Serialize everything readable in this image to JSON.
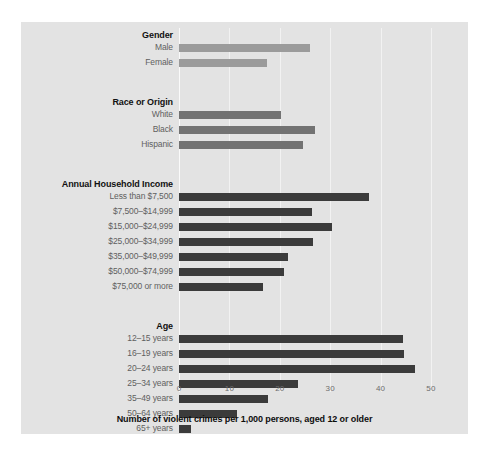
{
  "chart_data": {
    "type": "bar",
    "orientation": "horizontal",
    "title": "",
    "xlabel": "Number of violent crimes per 1,000 persons, aged 12 or older",
    "ylabel": "",
    "xlim": [
      0,
      55
    ],
    "xticks": [
      0,
      10,
      20,
      30,
      40,
      50
    ],
    "xtick_labels": [
      "0",
      "10",
      "20",
      "30",
      "40",
      "50"
    ],
    "grid": true,
    "legend": "none",
    "background_color": "#e3e3e3",
    "groups": [
      {
        "name": "Gender",
        "color": "#9b9b9b",
        "categories": [
          "Male",
          "Female"
        ],
        "values": [
          25.9,
          17.5
        ]
      },
      {
        "name": "Race or Origin",
        "color": "#727272",
        "categories": [
          "White",
          "Black",
          "Hispanic"
        ],
        "values": [
          20.2,
          27.0,
          24.6
        ]
      },
      {
        "name": "Annual Household Income",
        "color": "#3b3b3b",
        "categories": [
          "Less than $7,500",
          "$7,500–$14,999",
          "$15,000–$24,999",
          "$25,000–$34,999",
          "$35,000–$49,999",
          "$50,000–$74,999",
          "$75,000 or more"
        ],
        "values": [
          37.7,
          26.4,
          30.4,
          26.6,
          21.6,
          20.9,
          16.7
        ]
      },
      {
        "name": "Age",
        "color": "#3b3b3b",
        "categories": [
          "12–15 years",
          "16–19 years",
          "20–24 years",
          "25–34 years",
          "35–49 years",
          "50–64 years",
          "65+ years"
        ],
        "values": [
          44.4,
          44.6,
          46.8,
          23.6,
          17.7,
          11.5,
          2.4
        ]
      }
    ]
  }
}
